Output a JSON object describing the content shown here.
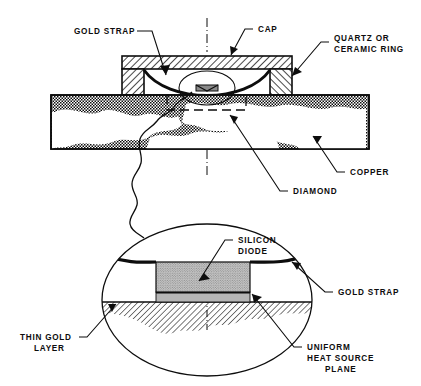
{
  "figure": {
    "type": "engineering-cross-section-diagram",
    "background_color": "#ffffff",
    "line_color": "#0d0d0d"
  },
  "labels": {
    "gold_strap_top": "GOLD STRAP",
    "cap": "CAP",
    "quartz_ring_line1": "QUARTZ OR",
    "quartz_ring_line2": "CERAMIC RING",
    "copper": "COPPER",
    "diamond": "DIAMOND",
    "silicon_diode_line1": "SILICON",
    "silicon_diode_line2": "DIODE",
    "gold_strap_detail": "GOLD STRAP",
    "thin_gold_layer_line1": "THIN GOLD",
    "thin_gold_layer_line2": "LAYER",
    "uniform_heat_line1": "UNIFORM",
    "uniform_heat_line2": "HEAT SOURCE",
    "uniform_heat_line3": "PLANE"
  },
  "parts": {
    "cap": {
      "name": "cap",
      "hatch": "diagonal-45",
      "color": "#0d0d0d"
    },
    "quartz_ring_left": {
      "name": "quartz-or-ceramic-ring-left",
      "hatch": "diagonal-45"
    },
    "quartz_ring_right": {
      "name": "quartz-or-ceramic-ring-right",
      "hatch": "diagonal-45"
    },
    "copper_block": {
      "name": "copper-block",
      "hatch": "stipple-dense",
      "fill": "#ffffff"
    },
    "gold_strap_curve": {
      "name": "gold-strap-curve",
      "style": "thick-curve"
    },
    "diamond_region": {
      "name": "diamond-region",
      "hatch": "diagonal-thin"
    },
    "silicon_diode_block": {
      "name": "silicon-diode-block",
      "fill": "#c9c9c9",
      "hatch": "stipple"
    },
    "thin_gold_layer": {
      "name": "thin-gold-layer",
      "fill": "#0d0d0d"
    },
    "uniform_heat_source_plane": {
      "name": "uniform-heat-source-plane",
      "fill": "#b5b5b5"
    },
    "detail_ellipse": {
      "name": "detail-enlargement-ellipse"
    },
    "detail_circle": {
      "name": "detail-callout-circle"
    },
    "dashed_box": {
      "name": "hidden-edge-dashed-box"
    },
    "centerline_upper": {
      "name": "centerline-upper",
      "style": "dash-dot"
    },
    "centerline_lower": {
      "name": "centerline-lower",
      "style": "dash-dot"
    },
    "break_line": {
      "name": "wavy-break-line"
    }
  },
  "colors": {
    "ink": "#0d0d0d",
    "diode_gray": "#c9c9c9",
    "heat_plane_gray": "#b5b5b5",
    "paper": "#ffffff"
  }
}
